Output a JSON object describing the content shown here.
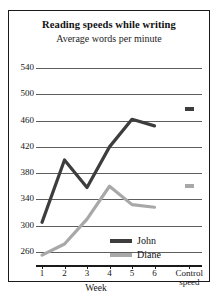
{
  "chart_data": {
    "type": "line",
    "title": "Reading speeds while writing",
    "subtitle": "Average words per minute",
    "xlabel": "Week",
    "ylabel": "",
    "ylim": [
      240,
      560
    ],
    "yticks": [
      260,
      300,
      340,
      380,
      420,
      460,
      500,
      540
    ],
    "grid": true,
    "legend_position": "inside-bottom-right",
    "categories": [
      "1",
      "2",
      "3",
      "4",
      "5",
      "6"
    ],
    "control_label_line1": "Control",
    "control_label_line2": "speed",
    "series": [
      {
        "name": "John",
        "color": "#3d3d3d",
        "values": [
          305,
          400,
          358,
          420,
          462,
          452
        ],
        "control_speed": 477
      },
      {
        "name": "Diane",
        "color": "#a8a8a8",
        "values": [
          255,
          272,
          310,
          360,
          332,
          328
        ],
        "control_speed": 360
      }
    ]
  },
  "axis": {
    "ytick_labels": [
      "540",
      "500",
      "460",
      "420",
      "380",
      "340",
      "300",
      "260"
    ],
    "xtick_labels": [
      "1",
      "2",
      "3",
      "4",
      "5",
      "6"
    ]
  },
  "legend": {
    "items": [
      {
        "label": "John"
      },
      {
        "label": "Diane"
      }
    ]
  },
  "colors": {
    "john": "#3d3d3d",
    "diane": "#a8a8a8",
    "grid": "#5d5d5d",
    "frame": "#1a1a1a",
    "background": "#ffffff"
  }
}
